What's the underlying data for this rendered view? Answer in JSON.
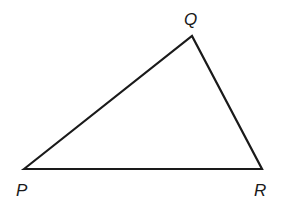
{
  "diagram": {
    "type": "triangle",
    "stroke_color": "#1a1a1a",
    "fill_color": "#ffffff",
    "vertices": [
      {
        "name": "P",
        "x": 24,
        "y": 169
      },
      {
        "name": "Q",
        "x": 192,
        "y": 36
      },
      {
        "name": "R",
        "x": 262,
        "y": 169
      }
    ],
    "labels": {
      "p": "P",
      "q": "Q",
      "r": "R"
    },
    "sides": [
      "PQ",
      "QR",
      "PR"
    ]
  }
}
